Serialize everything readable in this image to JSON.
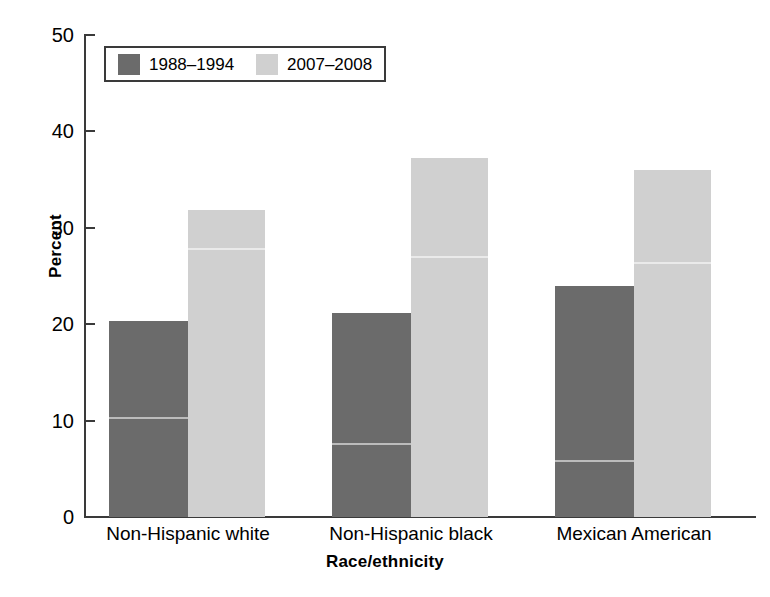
{
  "chart_data": {
    "type": "bar",
    "title": "",
    "xlabel": "Race/ethnicity",
    "ylabel": "Percent",
    "ylim": [
      0,
      50
    ],
    "yticks": [
      0,
      10,
      20,
      30,
      40,
      50
    ],
    "ytick_labels": [
      "0",
      "10",
      "20",
      "30",
      "40",
      "50"
    ],
    "grid": false,
    "legend_position": "top-left-inside",
    "categories": [
      "Non-Hispanic white",
      "Non-Hispanic black",
      "Mexican American"
    ],
    "series": [
      {
        "name": "1988–1994",
        "color": "#6b6b6b",
        "values": [
          20.3,
          21.1,
          23.9
        ]
      },
      {
        "name": "2007–2008",
        "color": "#d0d0d0",
        "values": [
          31.8,
          37.2,
          35.9
        ]
      }
    ]
  },
  "legend": {
    "entries": [
      {
        "label": "1988–1994",
        "swatch": "dark-gray-swatch"
      },
      {
        "label": "2007–2008",
        "swatch": "light-gray-swatch"
      }
    ]
  },
  "axes": {
    "y_title": "Percent",
    "x_title": "Race/ethnicity",
    "y_ticks": [
      "50",
      "40",
      "30",
      "20",
      "10",
      "0"
    ],
    "x_ticks": [
      "Non-Hispanic white",
      "Non-Hispanic black",
      "Mexican American"
    ]
  },
  "colors": {
    "series_1988_1994": "#6b6b6b",
    "series_2007_2008": "#d0d0d0",
    "axis": "#3a3a3a",
    "background": "#ffffff"
  }
}
